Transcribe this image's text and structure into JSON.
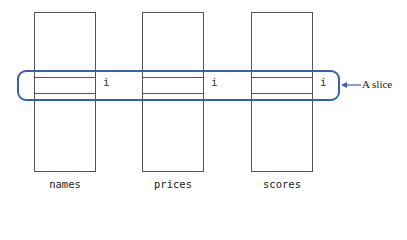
{
  "diagram": {
    "columns": [
      {
        "label": "names",
        "index_label": "i"
      },
      {
        "label": "prices",
        "index_label": "i"
      },
      {
        "label": "scores",
        "index_label": "i"
      }
    ],
    "callout": "A slice",
    "colors": {
      "slice": "#3a5fb0",
      "lines": "#555555"
    }
  }
}
